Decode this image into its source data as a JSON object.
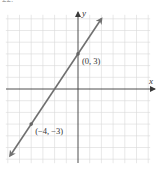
{
  "figure": {
    "label": "22."
  },
  "chart_data": {
    "type": "line",
    "title": "",
    "xlabel": "x",
    "ylabel": "y",
    "xlim": [
      -6,
      6
    ],
    "ylim": [
      -6,
      6
    ],
    "grid": true,
    "grid_step": 1,
    "equation": "y = (3/2)x + 3",
    "series": [
      {
        "name": "line",
        "x": [
          -6,
          -4,
          -2,
          0,
          2
        ],
        "y": [
          -6,
          -3,
          0,
          3,
          6
        ]
      }
    ],
    "points": [
      {
        "x": 0,
        "y": 3,
        "label": "(0, 3)"
      },
      {
        "x": -4,
        "y": -3,
        "label": "(−4, −3)"
      }
    ],
    "annotations": [
      "(0, 3)",
      "(−4, −3)"
    ],
    "colors": {
      "line": "#707070",
      "axis": "#3a3a3a",
      "grid": "#d9d9d9"
    }
  }
}
